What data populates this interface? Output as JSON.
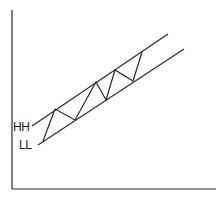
{
  "diagram": {
    "type": "ascending-channel",
    "colors": {
      "line": "#2a2a2a",
      "background": "#ffffff"
    },
    "axes": {
      "y": {
        "x": 12,
        "y1": 10,
        "y2": 189
      },
      "x": {
        "y": 189,
        "x1": 12,
        "x2": 216
      }
    },
    "channel_lines": [
      {
        "name": "upper-trendline",
        "x1": 32,
        "y1": 126,
        "x2": 168,
        "y2": 34
      },
      {
        "name": "lower-trendline",
        "x1": 38,
        "y1": 145,
        "x2": 184,
        "y2": 49
      }
    ],
    "zigzag_points": "43,141 55,109 75,120 96,82 106,100 115,70 133,81 142,52",
    "labels": [
      {
        "name": "hh-label",
        "text": "HH",
        "x": 13,
        "y": 121
      },
      {
        "name": "ll-label",
        "text": "LL",
        "x": 19,
        "y": 139
      }
    ]
  }
}
